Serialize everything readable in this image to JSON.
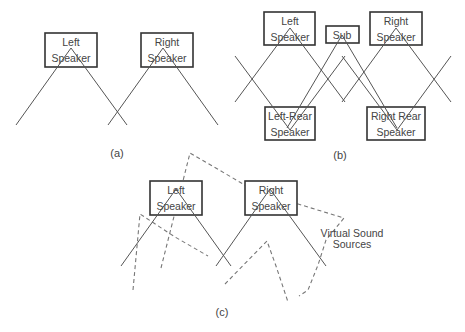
{
  "diagram": {
    "panels": [
      {
        "id": "a",
        "caption": "(a)",
        "speakers": [
          {
            "line1": "Left",
            "line2": "Speaker"
          },
          {
            "line1": "Right",
            "line2": "Speaker"
          }
        ]
      },
      {
        "id": "b",
        "caption": "(b)",
        "speakers": [
          {
            "line1": "Left",
            "line2": "Speaker"
          },
          {
            "line1": "Sub"
          },
          {
            "line1": "Right",
            "line2": "Speaker"
          },
          {
            "line1": "Left-Rear",
            "line2": "Speaker"
          },
          {
            "line1": "Right Rear",
            "line2": "Speaker"
          }
        ]
      },
      {
        "id": "c",
        "caption": "(c)",
        "speakers": [
          {
            "line1": "Left",
            "line2": "Speaker"
          },
          {
            "line1": "Right",
            "line2": "Speaker"
          }
        ],
        "annotation": {
          "line1": "Virtual Sound",
          "line2": "Sources"
        }
      }
    ],
    "colors": {
      "line": "#555555",
      "box": "#333333",
      "dashed": "#777777",
      "text": "#444444"
    }
  }
}
